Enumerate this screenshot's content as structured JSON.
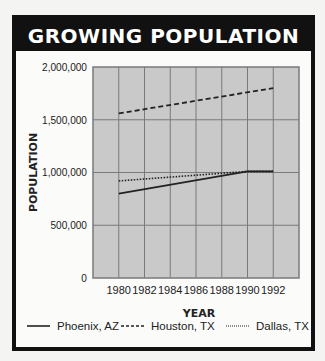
{
  "title": "GROWING POPULATION",
  "chart_data": {
    "type": "line",
    "title": "GROWING POPULATION",
    "xlabel": "YEAR",
    "ylabel": "POPULATION",
    "x": [
      1980,
      1982,
      1984,
      1986,
      1988,
      1990,
      1992
    ],
    "x_tick_labels": [
      "1980",
      "1982",
      "1984",
      "1986",
      "1988",
      "1990",
      "1992"
    ],
    "y_tick_labels": [
      "2,000,000",
      "1,500,000",
      "1,000,000",
      "500,000",
      "0"
    ],
    "y_ticks": [
      2000000,
      1500000,
      1000000,
      500000,
      0
    ],
    "ylim": [
      0,
      2000000
    ],
    "xlim": [
      1978,
      1994
    ],
    "grid": true,
    "legend_position": "bottom",
    "series": [
      {
        "name": "Phoenix, AZ",
        "style": "solid",
        "points": [
          [
            1980,
            800000
          ],
          [
            1990,
            1010000
          ],
          [
            1992,
            1010000
          ]
        ]
      },
      {
        "name": "Houston, TX",
        "style": "dashed",
        "points": [
          [
            1980,
            1560000
          ],
          [
            1992,
            1800000
          ]
        ]
      },
      {
        "name": "Dallas, TX",
        "style": "dotted",
        "points": [
          [
            1980,
            920000
          ],
          [
            1990,
            1010000
          ],
          [
            1992,
            1010000
          ]
        ]
      }
    ]
  },
  "legend": [
    {
      "label": "Phoenix, AZ",
      "style": "solid"
    },
    {
      "label": "Houston, TX",
      "style": "dashed"
    },
    {
      "label": "Dallas, TX",
      "style": "dotted"
    }
  ],
  "colors": {
    "plot_bg": "#c9c9c9",
    "grid": "#7a7a7a",
    "frame": "#111111",
    "line": "#222222"
  }
}
